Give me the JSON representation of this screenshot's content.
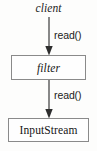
{
  "diagram": {
    "title_label": "client",
    "nodes": [
      {
        "id": "client",
        "label": "client",
        "style": "italic-text"
      },
      {
        "id": "filter",
        "label": "filter",
        "style": "italic-box"
      },
      {
        "id": "inputstream",
        "label": "InputStream",
        "style": "plain-box"
      }
    ],
    "edges": [
      {
        "from": "client",
        "to": "filter",
        "label": "read()"
      },
      {
        "from": "filter",
        "to": "inputstream",
        "label": "read()"
      }
    ],
    "edge_labels": {
      "first": "read()",
      "second": "read()"
    },
    "colors": {
      "background": "#fdfdfc",
      "box_fill": "#fefefe",
      "box_border": "#8a8a8a",
      "text": "#141414",
      "arrow": "#4a4a4a"
    }
  }
}
